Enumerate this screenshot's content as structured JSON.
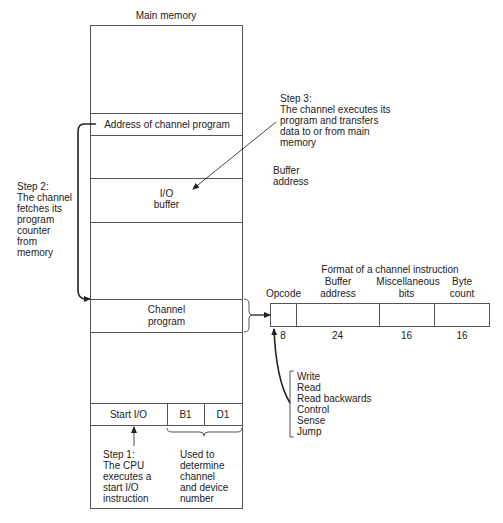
{
  "main_memory": {
    "title": "Main memory",
    "address_row": "Address of channel program",
    "io_buffer_line1": "I/O",
    "io_buffer_line2": "buffer",
    "channel_program_line1": "Channel",
    "channel_program_line2": "program",
    "start_io": "Start I/O",
    "b1": "B1",
    "d1": "D1"
  },
  "steps": {
    "step1": [
      "Step 1:",
      "The CPU",
      "executes a",
      "start I/O",
      "instruction"
    ],
    "step2": [
      "Step 2:",
      "The channel",
      "fetches its",
      "program",
      "counter",
      "from",
      "memory"
    ],
    "step3": [
      "Step 3:",
      "The channel executes its",
      "program and transfers",
      "data to or from main",
      "memory"
    ]
  },
  "used_to": [
    "Used to",
    "determine",
    "channel",
    "and device",
    "number"
  ],
  "buffer_address_note": [
    "Buffer",
    "address"
  ],
  "instruction_format": {
    "title": "Format of a channel instruction",
    "fields": [
      {
        "name_line1": "",
        "name_line2": "Opcode",
        "bits": "8"
      },
      {
        "name_line1": "Buffer",
        "name_line2": "address",
        "bits": "24"
      },
      {
        "name_line1": "Miscellaneous",
        "name_line2": "bits",
        "bits": "16"
      },
      {
        "name_line1": "Byte",
        "name_line2": "count",
        "bits": "16"
      }
    ]
  },
  "opcodes": [
    "Write",
    "Read",
    "Read backwards",
    "Control",
    "Sense",
    "Jump"
  ]
}
